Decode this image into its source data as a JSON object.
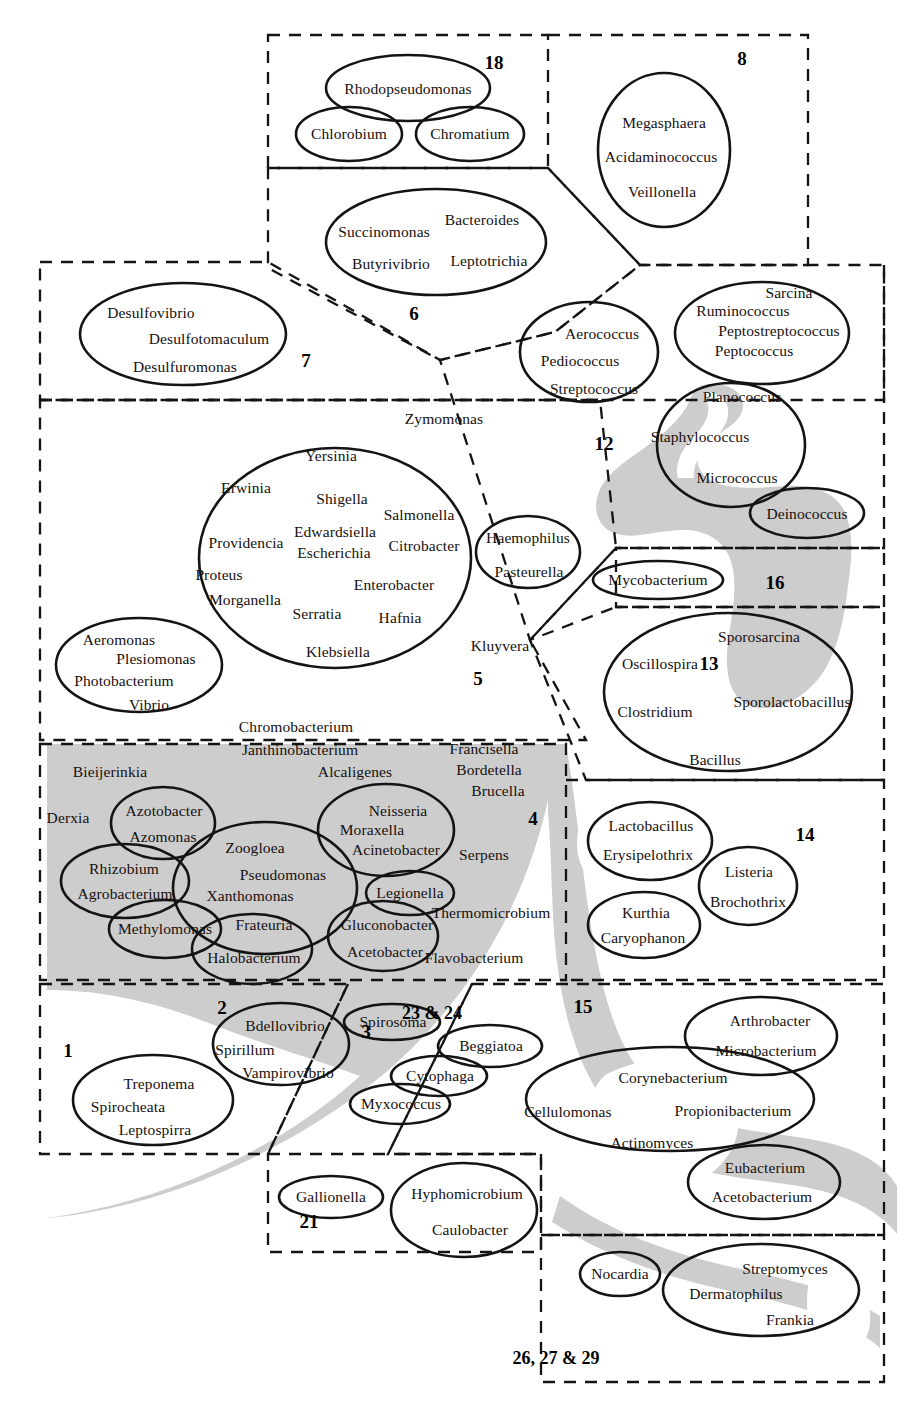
{
  "figure": {
    "type": "venn-euler-diagram",
    "width": 916,
    "height": 1416,
    "colors": {
      "background": "#ffffff",
      "shading": "#cdcdcd",
      "outline": "#1a1a1a",
      "dashed_border": "#1a1a1a",
      "text": "#15100e"
    }
  },
  "group_numbers": [
    {
      "id": "g18",
      "label": "18",
      "x": 494,
      "y": 62
    },
    {
      "id": "g8",
      "label": "8",
      "x": 742,
      "y": 58
    },
    {
      "id": "g6",
      "label": "6",
      "x": 414,
      "y": 313
    },
    {
      "id": "g7",
      "label": "7",
      "x": 306,
      "y": 360
    },
    {
      "id": "g12",
      "label": "12",
      "x": 604,
      "y": 443
    },
    {
      "id": "g5",
      "label": "5",
      "x": 478,
      "y": 678
    },
    {
      "id": "g16",
      "label": "16",
      "x": 775,
      "y": 582
    },
    {
      "id": "g13",
      "label": "13",
      "x": 709,
      "y": 663
    },
    {
      "id": "g4",
      "label": "4",
      "x": 533,
      "y": 818
    },
    {
      "id": "g14",
      "label": "14",
      "x": 805,
      "y": 834
    },
    {
      "id": "g2",
      "label": "2",
      "x": 222,
      "y": 1007
    },
    {
      "id": "g3",
      "label": "3",
      "x": 366,
      "y": 1031
    },
    {
      "id": "g23_24",
      "label": "23 & 24",
      "x": 432,
      "y": 1013
    },
    {
      "id": "g15",
      "label": "15",
      "x": 583,
      "y": 1006
    },
    {
      "id": "g1",
      "label": "1",
      "x": 68,
      "y": 1050
    },
    {
      "id": "g21",
      "label": "21",
      "x": 309,
      "y": 1221
    },
    {
      "id": "g26_27_29",
      "label": "26, 27 & 29",
      "x": 556,
      "y": 1358
    }
  ],
  "ellipses": [
    {
      "id": "e-rhodopseudomonas",
      "cx": 408,
      "cy": 88,
      "rx": 82,
      "ry": 33,
      "labels": [
        {
          "t": "Rhodopseudomonas",
          "x": 408,
          "y": 89
        }
      ]
    },
    {
      "id": "e-chlorobium",
      "cx": 349,
      "cy": 134,
      "rx": 53,
      "ry": 27,
      "labels": [
        {
          "t": "Chlorobium",
          "x": 349,
          "y": 134
        }
      ]
    },
    {
      "id": "e-chromatium",
      "cx": 470,
      "cy": 134,
      "rx": 54,
      "ry": 27,
      "labels": [
        {
          "t": "Chromatium",
          "x": 470,
          "y": 134
        }
      ]
    },
    {
      "id": "e-megasphaera",
      "cx": 664,
      "cy": 150,
      "rx": 66,
      "ry": 77,
      "labels": [
        {
          "t": "Megasphaera",
          "x": 664,
          "y": 123
        },
        {
          "t": "Acidaminococcus",
          "x": 661,
          "y": 157
        },
        {
          "t": "Veillonella",
          "x": 662,
          "y": 192
        }
      ]
    },
    {
      "id": "e-bacteroides",
      "cx": 436,
      "cy": 242,
      "rx": 110,
      "ry": 53,
      "labels": [
        {
          "t": "Bacteroides",
          "x": 482,
          "y": 220
        },
        {
          "t": "Succinomonas",
          "x": 384,
          "y": 232
        },
        {
          "t": "Butyrivibrio",
          "x": 391,
          "y": 264
        },
        {
          "t": "Leptotrichia",
          "x": 489,
          "y": 261
        }
      ]
    },
    {
      "id": "e-desulfovibrio",
      "cx": 183,
      "cy": 334,
      "rx": 103,
      "ry": 51,
      "labels": [
        {
          "t": "Desulfovibrio",
          "x": 151,
          "y": 313
        },
        {
          "t": "Desulfotomaculum",
          "x": 209,
          "y": 339
        },
        {
          "t": "Desulfuromonas",
          "x": 185,
          "y": 367
        }
      ]
    },
    {
      "id": "e-aerococcus",
      "cx": 589,
      "cy": 352,
      "rx": 69,
      "ry": 50,
      "labels": [
        {
          "t": "Aerococcus",
          "x": 602,
          "y": 334
        },
        {
          "t": "Pediococcus",
          "x": 580,
          "y": 361
        },
        {
          "t": "Streptococcus",
          "x": 594,
          "y": 389
        }
      ]
    },
    {
      "id": "e-sarcina",
      "cx": 762,
      "cy": 333,
      "rx": 87,
      "ry": 51,
      "labels": [
        {
          "t": "Sarcina",
          "x": 789,
          "y": 293
        },
        {
          "t": "Ruminococcus",
          "x": 743,
          "y": 311
        },
        {
          "t": "Peptostreptococcus",
          "x": 779,
          "y": 331
        },
        {
          "t": "Peptococcus",
          "x": 754,
          "y": 351
        }
      ]
    },
    {
      "id": "e-staphylococcus",
      "cx": 731,
      "cy": 445,
      "rx": 74,
      "ry": 62,
      "labels": [
        {
          "t": "Planococcus",
          "x": 742,
          "y": 397
        },
        {
          "t": "Staphylococcus",
          "x": 700,
          "y": 437
        },
        {
          "t": "Micrococcus",
          "x": 737,
          "y": 478
        }
      ]
    },
    {
      "id": "e-deinococcus",
      "cx": 807,
      "cy": 513,
      "rx": 57,
      "ry": 25,
      "labels": [
        {
          "t": "Deinococcus",
          "x": 807,
          "y": 514
        }
      ]
    },
    {
      "id": "e-enterobacteria",
      "cx": 335,
      "cy": 558,
      "rx": 136,
      "ry": 110,
      "labels": [
        {
          "t": "Yersinia",
          "x": 331,
          "y": 456
        },
        {
          "t": "Erwinia",
          "x": 246,
          "y": 488
        },
        {
          "t": "Shigella",
          "x": 342,
          "y": 499
        },
        {
          "t": "Salmonella",
          "x": 419,
          "y": 515
        },
        {
          "t": "Edwardsiella",
          "x": 335,
          "y": 532
        },
        {
          "t": "Escherichia",
          "x": 334,
          "y": 553
        },
        {
          "t": "Citrobacter",
          "x": 424,
          "y": 546
        },
        {
          "t": "Providencia",
          "x": 246,
          "y": 543
        },
        {
          "t": "Proteus",
          "x": 219,
          "y": 575
        },
        {
          "t": "Enterobacter",
          "x": 394,
          "y": 585
        },
        {
          "t": "Morganella",
          "x": 245,
          "y": 600
        },
        {
          "t": "Serratia",
          "x": 317,
          "y": 614
        },
        {
          "t": "Hafnia",
          "x": 400,
          "y": 618
        },
        {
          "t": "Klebsiella",
          "x": 338,
          "y": 652
        }
      ]
    },
    {
      "id": "e-haemophilus",
      "cx": 528,
      "cy": 552,
      "rx": 52,
      "ry": 36,
      "labels": [
        {
          "t": "Haemophilus",
          "x": 528,
          "y": 538
        },
        {
          "t": "Pasteurella",
          "x": 529,
          "y": 572
        }
      ]
    },
    {
      "id": "e-aeromonas",
      "cx": 139,
      "cy": 665,
      "rx": 83,
      "ry": 47,
      "labels": [
        {
          "t": "Aeromonas",
          "x": 119,
          "y": 640
        },
        {
          "t": "Plesiomonas",
          "x": 156,
          "y": 659
        },
        {
          "t": "Photobacterium",
          "x": 124,
          "y": 681
        },
        {
          "t": "Vibrio",
          "x": 149,
          "y": 705
        }
      ]
    },
    {
      "id": "e-mycobacterium",
      "cx": 658,
      "cy": 580,
      "rx": 65,
      "ry": 19,
      "labels": [
        {
          "t": "Mycobacterium",
          "x": 658,
          "y": 580
        }
      ]
    },
    {
      "id": "e-bacillus",
      "cx": 728,
      "cy": 692,
      "rx": 124,
      "ry": 79,
      "labels": [
        {
          "t": "Sporosarcina",
          "x": 759,
          "y": 637
        },
        {
          "t": "Oscillospira",
          "x": 660,
          "y": 664
        },
        {
          "t": "Sporolactobacillus",
          "x": 792,
          "y": 702
        },
        {
          "t": "Clostridium",
          "x": 655,
          "y": 712
        },
        {
          "t": "Bacillus",
          "x": 715,
          "y": 760
        }
      ]
    },
    {
      "id": "e-azotobacter",
      "cx": 163,
      "cy": 823,
      "rx": 52,
      "ry": 36,
      "labels": [
        {
          "t": "Azotobacter",
          "x": 164,
          "y": 811
        },
        {
          "t": "Azomonas",
          "x": 163,
          "y": 837
        }
      ]
    },
    {
      "id": "e-neisseria",
      "cx": 386,
      "cy": 830,
      "rx": 68,
      "ry": 46,
      "labels": [
        {
          "t": "Neisseria",
          "x": 398,
          "y": 811
        },
        {
          "t": "Moraxella",
          "x": 372,
          "y": 830
        },
        {
          "t": "Acinetobacter",
          "x": 396,
          "y": 850
        }
      ]
    },
    {
      "id": "e-rhizobium",
      "cx": 125,
      "cy": 881,
      "rx": 64,
      "ry": 37,
      "labels": [
        {
          "t": "Rhizobium",
          "x": 124,
          "y": 869
        },
        {
          "t": "Agrobacterium",
          "x": 125,
          "y": 894
        }
      ]
    },
    {
      "id": "e-pseudomonas",
      "cx": 265,
      "cy": 888,
      "rx": 92,
      "ry": 66,
      "labels": [
        {
          "t": "Zoogloea",
          "x": 255,
          "y": 848
        },
        {
          "t": "Pseudomonas",
          "x": 283,
          "y": 875
        },
        {
          "t": "Xanthomonas",
          "x": 250,
          "y": 896
        },
        {
          "t": "Frateuria",
          "x": 264,
          "y": 925
        }
      ]
    },
    {
      "id": "e-legionella",
      "cx": 410,
      "cy": 893,
      "rx": 44,
      "ry": 22,
      "labels": [
        {
          "t": "Legionella",
          "x": 410,
          "y": 893
        }
      ]
    },
    {
      "id": "e-methylomonas",
      "cx": 165,
      "cy": 929,
      "rx": 56,
      "ry": 29,
      "labels": [
        {
          "t": "Methylomonas",
          "x": 165,
          "y": 929
        }
      ]
    },
    {
      "id": "e-halobacterium",
      "cx": 252,
      "cy": 949,
      "rx": 60,
      "ry": 35,
      "labels": [
        {
          "t": "Halobacterium",
          "x": 254,
          "y": 958
        }
      ]
    },
    {
      "id": "e-gluconobacter",
      "cx": 383,
      "cy": 936,
      "rx": 55,
      "ry": 35,
      "labels": [
        {
          "t": "Gluconobacter",
          "x": 387,
          "y": 925
        },
        {
          "t": "Acetobacter",
          "x": 385,
          "y": 952
        }
      ]
    },
    {
      "id": "e-lactobacillus",
      "cx": 650,
      "cy": 841,
      "rx": 62,
      "ry": 39,
      "labels": [
        {
          "t": "Lactobacillus",
          "x": 651,
          "y": 826
        },
        {
          "t": "Erysipelothrix",
          "x": 648,
          "y": 855
        }
      ]
    },
    {
      "id": "e-listeria",
      "cx": 748,
      "cy": 886,
      "rx": 49,
      "ry": 39,
      "labels": [
        {
          "t": "Listeria",
          "x": 749,
          "y": 872
        },
        {
          "t": "Brochothrix",
          "x": 748,
          "y": 902
        }
      ]
    },
    {
      "id": "e-kurthia",
      "cx": 644,
      "cy": 925,
      "rx": 56,
      "ry": 33,
      "labels": [
        {
          "t": "Kurthia",
          "x": 646,
          "y": 913
        },
        {
          "t": "Caryophanon",
          "x": 643,
          "y": 938
        }
      ]
    },
    {
      "id": "e-spirosoma",
      "cx": 392,
      "cy": 1022,
      "rx": 48,
      "ry": 18,
      "labels": [
        {
          "t": "Spirosoma",
          "x": 393,
          "y": 1022
        }
      ]
    },
    {
      "id": "e-bdellovibrio",
      "cx": 281,
      "cy": 1044,
      "rx": 68,
      "ry": 41,
      "labels": [
        {
          "t": "Bdellovibrio",
          "x": 285,
          "y": 1026
        },
        {
          "t": "Spirillum",
          "x": 245,
          "y": 1050
        },
        {
          "t": "Vampirovibrio",
          "x": 288,
          "y": 1073
        }
      ]
    },
    {
      "id": "e-beggiatoa",
      "cx": 490,
      "cy": 1046,
      "rx": 52,
      "ry": 21,
      "labels": [
        {
          "t": "Beggiatoa",
          "x": 491,
          "y": 1046
        }
      ]
    },
    {
      "id": "e-cytophaga",
      "cx": 439,
      "cy": 1076,
      "rx": 48,
      "ry": 20,
      "labels": [
        {
          "t": "Cytophaga",
          "x": 440,
          "y": 1076
        }
      ]
    },
    {
      "id": "e-myxococcus",
      "cx": 400,
      "cy": 1104,
      "rx": 50,
      "ry": 20,
      "labels": [
        {
          "t": "Myxococcus",
          "x": 401,
          "y": 1104
        }
      ]
    },
    {
      "id": "e-treponema",
      "cx": 153,
      "cy": 1100,
      "rx": 80,
      "ry": 45,
      "labels": [
        {
          "t": "Treponema",
          "x": 159,
          "y": 1084
        },
        {
          "t": "Spirocheata",
          "x": 128,
          "y": 1107
        },
        {
          "t": "Leptospirra",
          "x": 155,
          "y": 1130
        }
      ]
    },
    {
      "id": "e-arthrobacter",
      "cx": 761,
      "cy": 1036,
      "rx": 76,
      "ry": 39,
      "labels": [
        {
          "t": "Arthrobacter",
          "x": 770,
          "y": 1021
        },
        {
          "t": "Microbacterium",
          "x": 766,
          "y": 1051
        }
      ]
    },
    {
      "id": "e-corynebacterium",
      "cx": 670,
      "cy": 1099,
      "rx": 144,
      "ry": 52,
      "labels": [
        {
          "t": "Corynebacterium",
          "x": 673,
          "y": 1078
        },
        {
          "t": "Cellulomonas",
          "x": 568,
          "y": 1112
        },
        {
          "t": "Propionibacterium",
          "x": 733,
          "y": 1111
        },
        {
          "t": "Actinomyces",
          "x": 652,
          "y": 1143
        }
      ]
    },
    {
      "id": "e-eubacterium",
      "cx": 764,
      "cy": 1182,
      "rx": 76,
      "ry": 37,
      "labels": [
        {
          "t": "Eubacterium",
          "x": 765,
          "y": 1168
        },
        {
          "t": "Acetobacterium",
          "x": 762,
          "y": 1197
        }
      ]
    },
    {
      "id": "e-gallionella",
      "cx": 331,
      "cy": 1197,
      "rx": 52,
      "ry": 21,
      "labels": [
        {
          "t": "Gallionella",
          "x": 331,
          "y": 1197
        }
      ]
    },
    {
      "id": "e-hyphomicrobium",
      "cx": 464,
      "cy": 1210,
      "rx": 73,
      "ry": 47,
      "labels": [
        {
          "t": "Hyphomicrobium",
          "x": 467,
          "y": 1194
        },
        {
          "t": "Caulobacter",
          "x": 470,
          "y": 1230
        }
      ]
    },
    {
      "id": "e-nocardia",
      "cx": 620,
      "cy": 1274,
      "rx": 40,
      "ry": 22,
      "labels": [
        {
          "t": "Nocardia",
          "x": 620,
          "y": 1274
        }
      ]
    },
    {
      "id": "e-streptomyces",
      "cx": 761,
      "cy": 1290,
      "rx": 98,
      "ry": 46,
      "labels": [
        {
          "t": "Streptomyces",
          "x": 785,
          "y": 1269
        },
        {
          "t": "Dermatophilus",
          "x": 736,
          "y": 1294
        },
        {
          "t": "Frankia",
          "x": 790,
          "y": 1320
        }
      ]
    }
  ],
  "free_labels": [
    {
      "t": "Zymomonas",
      "x": 444,
      "y": 419
    },
    {
      "t": "Kluyvera",
      "x": 500,
      "y": 646
    },
    {
      "t": "Chromobacterium",
      "x": 296,
      "y": 727
    },
    {
      "t": "Janthinobacterium",
      "x": 300,
      "y": 750
    },
    {
      "t": "Francisella",
      "x": 484,
      "y": 749
    },
    {
      "t": "Bieijerinkia",
      "x": 110,
      "y": 772
    },
    {
      "t": "Alcaligenes",
      "x": 355,
      "y": 772
    },
    {
      "t": "Bordetella",
      "x": 489,
      "y": 770
    },
    {
      "t": "Brucella",
      "x": 498,
      "y": 791
    },
    {
      "t": "Derxia",
      "x": 68,
      "y": 818
    },
    {
      "t": "Serpens",
      "x": 484,
      "y": 855
    },
    {
      "t": "Thermomicrobium",
      "x": 491,
      "y": 913
    },
    {
      "t": "Flavobacterium",
      "x": 474,
      "y": 958
    }
  ],
  "dashed_regions": [
    {
      "id": "r18",
      "name": "region-18"
    },
    {
      "id": "r8",
      "name": "region-8"
    },
    {
      "id": "r6",
      "name": "region-6"
    },
    {
      "id": "r7",
      "name": "region-7"
    },
    {
      "id": "r12",
      "name": "region-12"
    },
    {
      "id": "r5",
      "name": "region-5"
    },
    {
      "id": "r16",
      "name": "region-16"
    },
    {
      "id": "r13",
      "name": "region-13"
    },
    {
      "id": "r4",
      "name": "region-4"
    },
    {
      "id": "r14",
      "name": "region-14"
    },
    {
      "id": "r1",
      "name": "region-1"
    },
    {
      "id": "r3",
      "name": "region-3"
    },
    {
      "id": "r15",
      "name": "region-15"
    },
    {
      "id": "r21",
      "name": "region-21"
    },
    {
      "id": "r26",
      "name": "region-26-27-29"
    }
  ]
}
